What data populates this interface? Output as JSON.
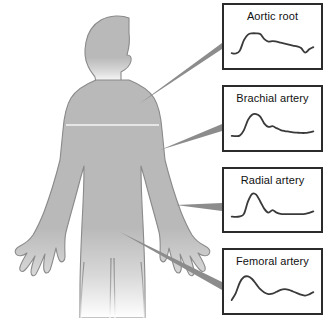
{
  "figure": {
    "background_color": "#ffffff",
    "width": 333,
    "height": 318
  },
  "body_figure": {
    "name": "human-body-silhouette",
    "description": "Gray human figure, head in profile facing right, arms abducted with open hands, legs fading out at the bottom",
    "fill_color": "#b9b9b9",
    "outline_color": "#8a8a8a"
  },
  "connectors": {
    "line_color": "#8c8c8c",
    "items": [
      {
        "name": "connector-aortic-root",
        "from": "upper chest / aortic root",
        "to": "Aortic root"
      },
      {
        "name": "connector-brachial-artery",
        "from": "upper arm",
        "to": "Brachial artery"
      },
      {
        "name": "connector-radial-artery",
        "from": "wrist",
        "to": "Radial artery"
      },
      {
        "name": "connector-femoral-artery",
        "from": "groin / hip",
        "to": "Femoral artery"
      }
    ]
  },
  "waveform_panels": [
    {
      "id": "aortic-root",
      "label": "Aortic root",
      "border_color": "#2b2b2b",
      "trace_color": "#3a3a3a",
      "box": {
        "left": 222,
        "top": 3,
        "width": 101,
        "height": 67
      }
    },
    {
      "id": "brachial-artery",
      "label": "Brachial artery",
      "border_color": "#2b2b2b",
      "trace_color": "#3a3a3a",
      "box": {
        "left": 222,
        "top": 85,
        "width": 101,
        "height": 67
      }
    },
    {
      "id": "radial-artery",
      "label": "Radial artery",
      "border_color": "#2b2b2b",
      "trace_color": "#3a3a3a",
      "box": {
        "left": 222,
        "top": 167,
        "width": 101,
        "height": 66
      }
    },
    {
      "id": "femoral-artery",
      "label": "Femoral artery",
      "border_color": "#2b2b2b",
      "trace_color": "#3a3a3a",
      "box": {
        "left": 222,
        "top": 248,
        "width": 101,
        "height": 67
      }
    }
  ],
  "chart_data": {
    "type": "line",
    "xlabel": "",
    "ylabel": "",
    "grid": false,
    "legend": "none",
    "x_description": "time within one cardiac cycle (normalized 0-1)",
    "y_description": "relative arterial pressure (normalized 0-1, larger = higher pressure)",
    "x": [
      0.0,
      0.05,
      0.1,
      0.15,
      0.2,
      0.25,
      0.3,
      0.35,
      0.4,
      0.45,
      0.5,
      0.55,
      0.6,
      0.65,
      0.7,
      0.75,
      0.8,
      0.85,
      0.9,
      0.95,
      1.0
    ],
    "series": [
      {
        "name": "Aortic root",
        "annotation": "broad rounded systolic plateau, shallow dicrotic notch, slow diastolic decay with small terminal dip",
        "values": [
          0.14,
          0.13,
          0.22,
          0.55,
          0.72,
          0.76,
          0.76,
          0.74,
          0.58,
          0.5,
          0.52,
          0.5,
          0.47,
          0.44,
          0.41,
          0.38,
          0.35,
          0.3,
          0.16,
          0.26,
          0.33
        ]
      },
      {
        "name": "Brachial artery",
        "annotation": "taller narrower systolic peak, distinct notch on the downstroke, low flat diastole",
        "values": [
          0.12,
          0.11,
          0.13,
          0.3,
          0.62,
          0.78,
          0.8,
          0.72,
          0.5,
          0.4,
          0.42,
          0.36,
          0.3,
          0.27,
          0.25,
          0.23,
          0.22,
          0.21,
          0.21,
          0.23,
          0.26
        ]
      },
      {
        "name": "Radial artery",
        "annotation": "tallest and narrowest systolic peak with steep upstroke and sharp distinct dicrotic notch",
        "values": [
          0.13,
          0.12,
          0.14,
          0.22,
          0.62,
          0.86,
          0.84,
          0.62,
          0.38,
          0.26,
          0.34,
          0.26,
          0.22,
          0.21,
          0.21,
          0.21,
          0.21,
          0.21,
          0.22,
          0.25,
          0.3
        ]
      },
      {
        "name": "Femoral artery",
        "annotation": "tall rounded systolic peak with steep upstroke and a smooth broad secondary diastolic wave",
        "values": [
          0.08,
          0.3,
          0.63,
          0.8,
          0.82,
          0.74,
          0.58,
          0.42,
          0.32,
          0.27,
          0.28,
          0.34,
          0.4,
          0.42,
          0.4,
          0.35,
          0.3,
          0.25,
          0.22,
          0.26,
          0.33
        ]
      }
    ]
  }
}
